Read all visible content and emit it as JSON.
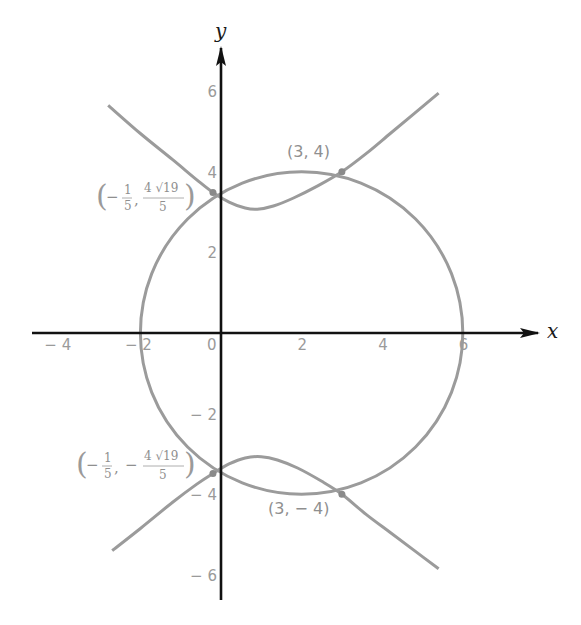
{
  "chart_data": {
    "type": "line",
    "title": "",
    "xlabel": "x",
    "ylabel": "y",
    "xlim": [
      -5,
      8
    ],
    "ylim": [
      -7,
      7
    ],
    "grid": false,
    "legend": null,
    "x_ticks": [
      -4,
      -2,
      0,
      2,
      4,
      6
    ],
    "x_tick_labels": [
      "− 4",
      "− 2",
      "0",
      "2",
      "4",
      "6"
    ],
    "y_ticks": [
      6,
      4,
      2,
      -2,
      -4,
      -6
    ],
    "y_tick_labels": [
      "6",
      "4",
      "2",
      "− 2",
      "− 4",
      "− 6"
    ],
    "series": [
      {
        "name": "circle",
        "kind": "circle",
        "center": [
          2,
          0
        ],
        "radius": 4,
        "color": "#9b9b9b"
      },
      {
        "name": "curve-upper-branch",
        "kind": "polyline",
        "color": "#9b9b9b",
        "points": [
          [
            -2.8,
            5.65
          ],
          [
            -2.0,
            4.95
          ],
          [
            -1.2,
            4.3
          ],
          [
            -0.6,
            3.8
          ],
          [
            -0.2,
            3.487
          ],
          [
            0.2,
            3.25
          ],
          [
            0.6,
            3.1
          ],
          [
            0.9,
            3.07
          ],
          [
            1.3,
            3.15
          ],
          [
            1.8,
            3.35
          ],
          [
            2.4,
            3.65
          ],
          [
            3.0,
            4.0
          ],
          [
            3.6,
            4.45
          ],
          [
            4.2,
            4.95
          ],
          [
            4.8,
            5.45
          ],
          [
            5.4,
            5.95
          ]
        ]
      },
      {
        "name": "curve-lower-branch",
        "kind": "polyline",
        "color": "#9b9b9b",
        "points": [
          [
            -2.7,
            -5.4
          ],
          [
            -2.0,
            -4.85
          ],
          [
            -1.2,
            -4.2
          ],
          [
            -0.6,
            -3.75
          ],
          [
            -0.2,
            -3.487
          ],
          [
            0.2,
            -3.25
          ],
          [
            0.6,
            -3.1
          ],
          [
            1.0,
            -3.07
          ],
          [
            1.4,
            -3.15
          ],
          [
            1.9,
            -3.35
          ],
          [
            2.5,
            -3.68
          ],
          [
            3.0,
            -4.0
          ],
          [
            3.6,
            -4.5
          ],
          [
            4.2,
            -4.95
          ],
          [
            4.8,
            -5.4
          ],
          [
            5.4,
            -5.85
          ]
        ]
      }
    ],
    "intersection_points": [
      {
        "x": 3,
        "y": 4,
        "label": "(3, 4)"
      },
      {
        "x": -0.2,
        "y": 3.487,
        "label": "(− 1/5, 4√19/5)"
      },
      {
        "x": -0.2,
        "y": -3.487,
        "label": "(− 1/5, − 4√19/5)"
      },
      {
        "x": 3,
        "y": -4,
        "label": "(3, − 4)"
      }
    ]
  },
  "axes": {
    "x_name": "x",
    "y_name": "y",
    "axis_color": "#111111"
  },
  "labels": {
    "p1": "(3, 4)",
    "p4": "(3, − 4)",
    "p2": {
      "minus": "−",
      "num1": "1",
      "den1": "5",
      "num2": "4 √19",
      "den2": "5"
    },
    "p3": {
      "minus": "−",
      "num1": "1",
      "den1": "5",
      "minus2": "−",
      "num2": "4 √19",
      "den2": "5"
    },
    "paren_open": "(",
    "paren_close": ")",
    "comma": ","
  }
}
